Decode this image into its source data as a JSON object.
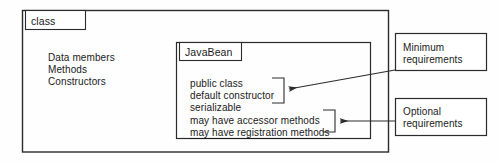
{
  "diagram": {
    "stroke_color": "#2b2b2b",
    "text_color": "#1a1a1a",
    "background_color": "#fefefe",
    "outer_box": {
      "tab_label": "class",
      "members": [
        "Data members",
        "Methods",
        "Constructors"
      ]
    },
    "inner_box": {
      "tab_label": "JavaBean",
      "requirements": [
        {
          "text": "public class",
          "group": "minimum",
          "underlined": false
        },
        {
          "text": "default constructor",
          "group": "minimum",
          "underlined": false
        },
        {
          "text": "serializable",
          "group": "minimum",
          "underlined": false
        },
        {
          "text": "may have accessor methods",
          "group": "optional",
          "underlined": false
        },
        {
          "text": "may have registration methods",
          "group": "optional",
          "underlined": true
        }
      ]
    },
    "callouts": [
      {
        "id": "minimum",
        "line1": "Minimum",
        "line2": "requirements",
        "points_to": "public class / default constructor / serializable"
      },
      {
        "id": "optional",
        "line1": "Optional",
        "line2": "requirements",
        "points_to": "may have accessor methods / may have registration methods"
      }
    ]
  }
}
